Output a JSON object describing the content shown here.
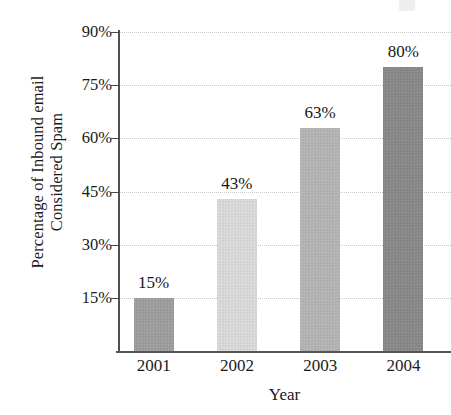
{
  "chart_data": {
    "type": "bar",
    "title": "",
    "categories": [
      "2001",
      "2002",
      "2003",
      "2004"
    ],
    "values": [
      15,
      43,
      63,
      80
    ],
    "data_labels": [
      "15%",
      "43%",
      "63%",
      "80%"
    ],
    "xlabel": "Year",
    "ylabel_lines": [
      "Percentage of Inbound email",
      "Considered Spam"
    ],
    "ylabel": "Percentage of Inbound email Considered Spam",
    "ylim": [
      0,
      90
    ],
    "yticks": [
      15,
      30,
      45,
      60,
      75,
      90
    ],
    "ytick_labels": [
      "15%",
      "30%",
      "45%",
      "60%",
      "75%",
      "90%"
    ],
    "grid": true,
    "grid_style": "dotted",
    "legend": "none",
    "bar_colors": [
      "#9e9e9e",
      "#d8d8d8",
      "#b4b4b4",
      "#8a8a8a"
    ],
    "bar_texture": "checkered-dither",
    "axis_color": "#4f4f4f",
    "text_color": "#1a1a1a",
    "background": "#ffffff"
  },
  "axis": {
    "y_title_line1": "Percentage of Inbound email",
    "y_title_line2": "Considered Spam",
    "x_title": "Year"
  },
  "yticks": [
    {
      "label": "90%",
      "value": 90
    },
    {
      "label": "75%",
      "value": 75
    },
    {
      "label": "60%",
      "value": 60
    },
    {
      "label": "45%",
      "value": 45
    },
    {
      "label": "30%",
      "value": 30
    },
    {
      "label": "15%",
      "value": 15
    }
  ],
  "bars": [
    {
      "category": "2001",
      "label": "15%",
      "value": 15
    },
    {
      "category": "2002",
      "label": "43%",
      "value": 43
    },
    {
      "category": "2003",
      "label": "63%",
      "value": 63
    },
    {
      "category": "2004",
      "label": "80%",
      "value": 80
    }
  ]
}
